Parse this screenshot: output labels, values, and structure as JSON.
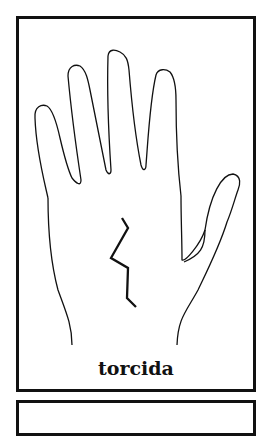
{
  "illustration": {
    "subject": "hand-outline-icon",
    "line_type": "zigzag-line"
  },
  "caption": "torcida",
  "colors": {
    "stroke": "#111111",
    "background": "#ffffff"
  }
}
